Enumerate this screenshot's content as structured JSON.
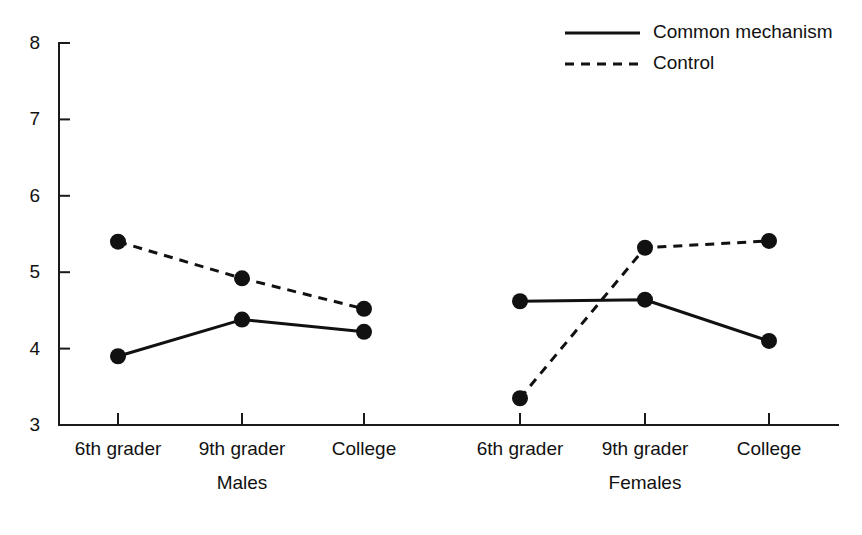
{
  "chart_data": {
    "type": "line",
    "title": "",
    "subtitle": "",
    "xlabel": "",
    "ylabel": "",
    "ylim": [
      3,
      8
    ],
    "yticks": [
      3,
      4,
      5,
      6,
      7,
      8
    ],
    "ytick_labels": [
      "3",
      "4",
      "5",
      "6",
      "7",
      "8"
    ],
    "grid": false,
    "legend_position": "top-right",
    "categories": [
      "6th grader",
      "9th grader",
      "College"
    ],
    "groups": [
      {
        "name": "Males",
        "label": "Males",
        "categories": [
          "6th grader",
          "9th grader",
          "College"
        ],
        "series": [
          {
            "name": "Common mechanism",
            "style": "solid",
            "values": [
              3.9,
              4.38,
              4.22
            ]
          },
          {
            "name": "Control",
            "style": "dashed",
            "values": [
              5.4,
              4.92,
              4.52
            ]
          }
        ]
      },
      {
        "name": "Females",
        "label": "Females",
        "categories": [
          "6th grader",
          "9th grader",
          "College"
        ],
        "series": [
          {
            "name": "Common mechanism",
            "style": "solid",
            "values": [
              4.62,
              4.64,
              4.1
            ]
          },
          {
            "name": "Control",
            "style": "dashed",
            "values": [
              3.35,
              5.32,
              5.41
            ]
          }
        ]
      }
    ],
    "legend": [
      {
        "name": "Common mechanism",
        "style": "solid"
      },
      {
        "name": "Control",
        "style": "dashed"
      }
    ],
    "colors": {
      "series": "#111111",
      "axis": "#1a1a1a",
      "background": "#ffffff"
    }
  },
  "geometry": {
    "plot_left": 59,
    "plot_right": 838,
    "y_top_px": 43,
    "y_bottom_px": 425,
    "tick_x": {
      "males": [
        118,
        242,
        364
      ],
      "females": [
        520,
        645,
        769
      ]
    },
    "group_label_y": 489,
    "xtick_label_y": 455,
    "legend": {
      "x_line_start": 565,
      "x_line_end": 640,
      "x_text": 653,
      "y_rows": [
        33,
        64
      ]
    },
    "marker_radius": 8
  }
}
